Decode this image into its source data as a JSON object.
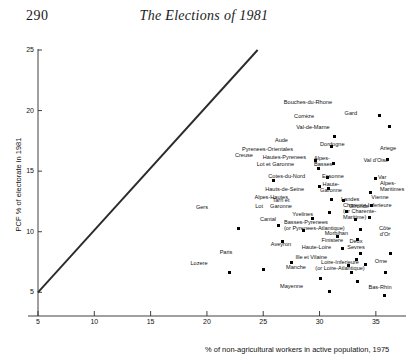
{
  "page": {
    "folio": "290",
    "running_head": "The Elections of 1981"
  },
  "chart_data": {
    "type": "scatter",
    "title": "",
    "xlabel": "% of non-agricultural workers in active population, 1975",
    "ylabel": "PCF % of electorate in 1981",
    "xlim": [
      5,
      37.5
    ],
    "ylim": [
      4.2,
      25
    ],
    "xticks": [
      5,
      10,
      15,
      20,
      25,
      30,
      35
    ],
    "yticks": [
      5,
      10,
      15,
      20,
      25
    ],
    "grid": false,
    "legend": null,
    "reference_line": {
      "name": "diagonal-reference-line",
      "from": [
        5,
        5
      ],
      "to": [
        24.5,
        25
      ]
    },
    "points": [
      {
        "label": "Bouches-du-Rhone",
        "x": 35.3,
        "y": 19.6,
        "lx": 332,
        "ly": 99,
        "la": "r"
      },
      {
        "label": "Gard",
        "x": 36.2,
        "y": 18.7,
        "lx": 357,
        "ly": 110,
        "la": "r"
      },
      {
        "label": "Corrèze",
        "x": 31.3,
        "y": 17.9,
        "lx": 314,
        "ly": 113,
        "la": "r"
      },
      {
        "label": "Val-de-Marne",
        "x": 31.1,
        "y": 17.0,
        "lx": 313,
        "ly": 124,
        "la": "c"
      },
      {
        "label": "Ariege",
        "x": 36.0,
        "y": 16.0,
        "lx": 388,
        "ly": 145,
        "la": "c"
      },
      {
        "label": "Aude",
        "x": 29.6,
        "y": 15.9,
        "lx": 288,
        "ly": 137,
        "la": "r"
      },
      {
        "label": "Dordogne",
        "x": 31.2,
        "y": 15.6,
        "lx": 320,
        "ly": 141,
        "la": "l"
      },
      {
        "label": "Pyrenees-Orientales",
        "x": 29.9,
        "y": 15.2,
        "lx": 293,
        "ly": 146,
        "la": "r"
      },
      {
        "label": "Hautes-Pyrenees",
        "x": 30.7,
        "y": 14.5,
        "lx": 306,
        "ly": 154,
        "la": "r"
      },
      {
        "label": "Val d'Oise",
        "x": 35.0,
        "y": 14.4,
        "lx": 376,
        "ly": 157,
        "la": "c"
      },
      {
        "label": "Creuse",
        "x": 25.9,
        "y": 14.2,
        "lx": 253,
        "ly": 152,
        "la": "r"
      },
      {
        "label": "Lot et Garonne",
        "x": 30.0,
        "y": 13.7,
        "lx": 294,
        "ly": 161,
        "la": "r"
      },
      {
        "label": "Alpes-\nBasses",
        "x": 30.8,
        "y": 13.6,
        "lx": 314,
        "ly": 158,
        "la": "l"
      },
      {
        "label": "Var",
        "x": 34.5,
        "y": 13.2,
        "lx": 378,
        "ly": 174,
        "la": "l"
      },
      {
        "label": "Cotes-du-Nord",
        "x": 31.1,
        "y": 12.7,
        "lx": 305,
        "ly": 173,
        "la": "r"
      },
      {
        "label": "Essonne",
        "x": 32.1,
        "y": 12.6,
        "lx": 322,
        "ly": 173,
        "la": "l"
      },
      {
        "label": "Alpes-\nMaritimes",
        "x": 34.6,
        "y": 12.2,
        "lx": 380,
        "ly": 183,
        "la": "l"
      },
      {
        "label": "Hauts-de-Seine",
        "x": 30.9,
        "y": 11.6,
        "lx": 304,
        "ly": 186,
        "la": "r"
      },
      {
        "label": "Haute-\nGaronne",
        "x": 32.4,
        "y": 11.7,
        "lx": 331,
        "ly": 184,
        "la": "c"
      },
      {
        "label": "Vienne",
        "x": 34.4,
        "y": 11.2,
        "lx": 380,
        "ly": 194,
        "la": "c"
      },
      {
        "label": "Alpes-Hautes",
        "x": 29.4,
        "y": 11.1,
        "lx": 288,
        "ly": 194,
        "la": "r"
      },
      {
        "label": "Landes",
        "x": 33.2,
        "y": 11.0,
        "lx": 341,
        "ly": 196,
        "la": "l"
      },
      {
        "label": "Gers",
        "x": 22.8,
        "y": 10.3,
        "lx": 208,
        "ly": 204,
        "la": "r"
      },
      {
        "label": "Lot",
        "x": 26.4,
        "y": 10.5,
        "lx": 263,
        "ly": 203,
        "la": "r"
      },
      {
        "label": "Tarn et\nGaronne",
        "x": 28.6,
        "y": 10.1,
        "lx": 281,
        "ly": 200,
        "la": "c"
      },
      {
        "label": "Gironde",
        "x": 33.6,
        "y": 10.2,
        "lx": 349,
        "ly": 203,
        "la": "l"
      },
      {
        "label": "Yvelines",
        "x": 31.6,
        "y": 9.6,
        "lx": 313,
        "ly": 211,
        "la": "r"
      },
      {
        "label": "Charente-Inferieure\n(or Charente-\nMaritime)",
        "x": 33.4,
        "y": 9.4,
        "lx": 343,
        "ly": 208,
        "la": "l"
      },
      {
        "label": "Cantal",
        "x": 26.7,
        "y": 9.2,
        "lx": 268,
        "ly": 216,
        "la": "c"
      },
      {
        "label": "Basses-Pyrenees\n(or Pyrenees-Atlantique)",
        "x": 32.0,
        "y": 8.6,
        "lx": 284,
        "ly": 222,
        "la": "l"
      },
      {
        "label": "Morbihan",
        "x": 33.6,
        "y": 8.2,
        "lx": 348,
        "ly": 230,
        "la": "r"
      },
      {
        "label": "Côte\nd'Or",
        "x": 36.3,
        "y": 8.2,
        "lx": 385,
        "ly": 228,
        "la": "c"
      },
      {
        "label": "Finistere",
        "x": 33.3,
        "y": 7.7,
        "lx": 343,
        "ly": 237,
        "la": "r"
      },
      {
        "label": "Aveyron",
        "x": 27.5,
        "y": 7.5,
        "lx": 281,
        "ly": 241,
        "la": "c"
      },
      {
        "label": "Haute-Loire",
        "x": 32.6,
        "y": 7.2,
        "lx": 331,
        "ly": 244,
        "la": "r"
      },
      {
        "label": "Deux\nSevres",
        "x": 34.1,
        "y": 7.3,
        "lx": 356,
        "ly": 241,
        "la": "c"
      },
      {
        "label": "Paris",
        "x": 25.0,
        "y": 6.9,
        "lx": 226,
        "ly": 249,
        "la": "c"
      },
      {
        "label": "Ille et Vilaine",
        "x": 32.8,
        "y": 6.6,
        "lx": 327,
        "ly": 254,
        "la": "r"
      },
      {
        "label": "Orne",
        "x": 35.9,
        "y": 6.6,
        "lx": 381,
        "ly": 258,
        "la": "c"
      },
      {
        "label": "Lozere",
        "x": 22.0,
        "y": 6.6,
        "lx": 199,
        "ly": 260,
        "la": "c"
      },
      {
        "label": "Manche",
        "x": 30.1,
        "y": 6.1,
        "lx": 296,
        "ly": 264,
        "la": "c"
      },
      {
        "label": "Loire-Inferieure\n(or Loire-Atlantique)",
        "x": 33.4,
        "y": 5.9,
        "lx": 340,
        "ly": 262,
        "la": "c"
      },
      {
        "label": "Mayenne",
        "x": 30.9,
        "y": 5.1,
        "lx": 303,
        "ly": 283,
        "la": "r"
      },
      {
        "label": "Bas-Rhin",
        "x": 35.8,
        "y": 4.7,
        "lx": 380,
        "ly": 284,
        "la": "c"
      }
    ]
  }
}
